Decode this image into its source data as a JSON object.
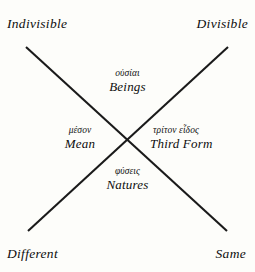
{
  "diagram": {
    "line_color": "#1a1a1a",
    "background_color": "#fdfdfa",
    "corners": {
      "top_left": "Indivisible",
      "top_right": "Divisible",
      "bottom_left": "Different",
      "bottom_right": "Same"
    },
    "quadrants": {
      "top": {
        "greek": "οὐσίαι",
        "english": "Beings"
      },
      "left": {
        "greek": "μέσον",
        "english": "Mean"
      },
      "right": {
        "greek": "τρίτον εἶδος",
        "english": "Third Form"
      },
      "bottom": {
        "greek": "φύσεις",
        "english": "Natures"
      }
    }
  }
}
